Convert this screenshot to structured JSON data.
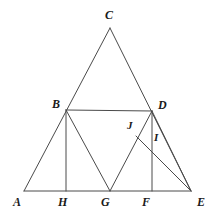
{
  "figure": {
    "type": "geometry-diagram",
    "width": 216,
    "height": 216,
    "background_color": "#ffffff",
    "stroke_color": "#4a4a4a",
    "label_color": "#1a1a1a",
    "stroke_width": 1,
    "points": [
      {
        "name": "A",
        "label": "A",
        "x": 24,
        "y": 191,
        "label_x": 13,
        "label_y": 196
      },
      {
        "name": "B",
        "label": "B",
        "x": 66,
        "y": 110,
        "label_x": 52,
        "label_y": 98
      },
      {
        "name": "C",
        "label": "C",
        "x": 110,
        "y": 28,
        "label_x": 105,
        "label_y": 9
      },
      {
        "name": "D",
        "label": "D",
        "x": 152,
        "y": 111,
        "label_x": 158,
        "label_y": 99
      },
      {
        "name": "E",
        "label": "E",
        "x": 191,
        "y": 191,
        "label_x": 197,
        "label_y": 196
      },
      {
        "name": "F",
        "label": "F",
        "x": 152,
        "y": 191,
        "label_x": 142,
        "label_y": 196
      },
      {
        "name": "G",
        "label": "G",
        "x": 110,
        "y": 191,
        "label_x": 101,
        "label_y": 196
      },
      {
        "name": "H",
        "label": "H",
        "x": 66,
        "y": 191,
        "label_x": 58,
        "label_y": 196
      },
      {
        "name": "I",
        "label": "I",
        "x": 158,
        "y": 146,
        "label_x": 154,
        "label_y": 132
      },
      {
        "name": "J",
        "label": "J",
        "x": 136,
        "y": 136,
        "label_x": 127,
        "label_y": 120
      }
    ],
    "segments": [
      {
        "name": "base-A-E",
        "from": "A",
        "to": "E"
      },
      {
        "name": "side-A-C",
        "from": "A",
        "to": "C"
      },
      {
        "name": "side-C-E",
        "from": "C",
        "to": "E"
      },
      {
        "name": "midline-B-D",
        "from": "B",
        "to": "D"
      },
      {
        "name": "altitude-B-H",
        "from": "B",
        "to": "H"
      },
      {
        "name": "diagonal-B-G",
        "from": "B",
        "to": "G"
      },
      {
        "name": "diagonal-G-D",
        "from": "G",
        "to": "D"
      },
      {
        "name": "altitude-D-F",
        "from": "D",
        "to": "F"
      },
      {
        "name": "diagonal-D-E",
        "from": "D",
        "to": "E"
      },
      {
        "name": "diagonal-J-E",
        "from": "J",
        "to": "E"
      }
    ]
  }
}
